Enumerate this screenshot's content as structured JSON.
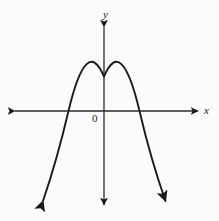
{
  "figure": {
    "name": "downward-parabola-graph",
    "background_color": "#fbfbfb",
    "stroke_color": "#1a1a1a",
    "width": 219,
    "height": 221
  },
  "labels": {
    "x_axis": "x",
    "y_axis": "y",
    "origin": "0"
  },
  "chart_data": {
    "type": "line",
    "title": "",
    "xlabel": "x",
    "ylabel": "y",
    "subtitle": "",
    "legend": [],
    "grid": false,
    "annotations": [
      "0"
    ],
    "axis_style": {
      "x_axis_pixel_y": 111,
      "y_axis_pixel_x": 104,
      "x_axis_arrows": "both",
      "y_axis_arrows": "both",
      "x_axis_extent_px": [
        13,
        200
      ],
      "y_axis_extent_px": [
        25,
        207
      ],
      "tick_labels_x": [],
      "tick_labels_y": []
    },
    "series": [
      {
        "name": "parabola",
        "shape": "downward-opening parabola",
        "arrows": "both ends",
        "vertex_px": [
          104,
          76
        ],
        "x_intercepts_px": [
          68,
          140
        ],
        "endpoints_px": [
          [
            41,
            205
          ],
          [
            170,
            205
          ]
        ],
        "path": "M 41 205 Q 55 157 68 111 Q 86 46 104 76 Q 122 46 140 111 Q 155 157 170 205",
        "x": [
          41,
          50,
          59,
          68,
          77,
          86,
          95,
          104,
          113,
          122,
          131,
          140,
          149,
          158,
          170
        ],
        "y": [
          205,
          174,
          147,
          111,
          94,
          83,
          77,
          76,
          77,
          83,
          94,
          111,
          147,
          174,
          205
        ]
      }
    ],
    "ylim": [
      221,
      0
    ],
    "xlim": [
      0,
      219
    ]
  }
}
